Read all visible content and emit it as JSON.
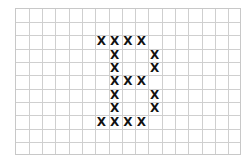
{
  "grid": {
    "columns": 17,
    "rows": 11,
    "line_color": "#cfcfcf"
  },
  "marks": {
    "glyph": "X",
    "color": "#111111",
    "cells": [
      [
        2,
        6
      ],
      [
        2,
        7
      ],
      [
        2,
        8
      ],
      [
        2,
        9
      ],
      [
        3,
        7
      ],
      [
        3,
        10
      ],
      [
        4,
        7
      ],
      [
        4,
        10
      ],
      [
        5,
        7
      ],
      [
        5,
        8
      ],
      [
        5,
        9
      ],
      [
        6,
        7
      ],
      [
        6,
        10
      ],
      [
        7,
        7
      ],
      [
        7,
        10
      ],
      [
        8,
        6
      ],
      [
        8,
        7
      ],
      [
        8,
        8
      ],
      [
        8,
        9
      ]
    ]
  }
}
